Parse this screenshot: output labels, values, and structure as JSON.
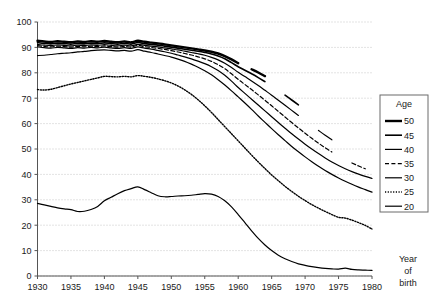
{
  "figure": {
    "title_fragment": "",
    "background": "#ffffff",
    "line_color": "#000000",
    "grid_color": "#b9b9b9"
  },
  "axes": {
    "x_label_lines": [
      "Year",
      "of",
      "birth"
    ],
    "x_ticks": [
      "1930",
      "1935",
      "1940",
      "1945",
      "1950",
      "1955",
      "1960",
      "1965",
      "1970",
      "1975",
      "1980"
    ],
    "y_ticks": [
      "0",
      "10",
      "20",
      "30",
      "40",
      "50",
      "60",
      "70",
      "80",
      "90",
      "100"
    ]
  },
  "legend": {
    "title": "Age",
    "items": [
      {
        "label": "50",
        "style": "solid",
        "width": 2.4
      },
      {
        "label": "45",
        "style": "solid",
        "width": 1.6
      },
      {
        "label": "40",
        "style": "solid",
        "width": 1.2
      },
      {
        "label": "35",
        "style": "dashed",
        "width": 1.2
      },
      {
        "label": "30",
        "style": "solid",
        "width": 1.2
      },
      {
        "label": "25",
        "style": "dotted",
        "width": 1.4
      },
      {
        "label": "20",
        "style": "solid",
        "width": 1.2
      }
    ]
  },
  "chart_data": {
    "type": "line",
    "title": "",
    "xlabel": "Year of birth",
    "ylabel": "",
    "xlim": [
      1930,
      1980
    ],
    "ylim": [
      0,
      100
    ],
    "x_tick_step": 5,
    "y_tick_step": 10,
    "grid": "horizontal-dotted",
    "legend_position": "right",
    "x": [
      1930,
      1931,
      1932,
      1933,
      1934,
      1935,
      1936,
      1937,
      1938,
      1939,
      1940,
      1941,
      1942,
      1943,
      1944,
      1945,
      1946,
      1947,
      1948,
      1949,
      1950,
      1951,
      1952,
      1953,
      1954,
      1955,
      1956,
      1957,
      1958,
      1959,
      1960,
      1961,
      1962,
      1963,
      1964,
      1965,
      1966,
      1967,
      1968,
      1969,
      1970,
      1971,
      1972,
      1973,
      1974,
      1975,
      1976,
      1977,
      1978,
      1979,
      1980
    ],
    "series": [
      {
        "name": "50",
        "style": "solid",
        "width": 2.4,
        "last_year": 1960,
        "stub_year": 1964,
        "values": [
          92.6,
          92.3,
          92.1,
          92.4,
          92.2,
          92.0,
          92.3,
          92.1,
          92.4,
          92.2,
          92.5,
          92.2,
          92.0,
          92.3,
          92.0,
          92.6,
          92.2,
          91.9,
          91.6,
          91.2,
          90.8,
          90.4,
          90.0,
          89.6,
          89.2,
          88.8,
          88.3,
          87.6,
          86.6,
          85.3,
          83.8,
          82.6,
          81.4,
          80.1,
          78.7,
          77.2,
          75.6,
          73.9,
          72.2,
          70.5,
          68.8,
          67.0,
          65.2,
          63.3,
          61.4,
          59.4,
          57.5,
          55.6,
          53.8,
          52.1,
          50.4
        ]
      },
      {
        "name": "45",
        "style": "solid",
        "width": 1.6,
        "last_year": 1964,
        "stub_year": 1969,
        "values": [
          91.9,
          91.6,
          91.4,
          91.7,
          91.5,
          91.3,
          91.6,
          91.4,
          91.7,
          91.5,
          91.8,
          91.5,
          91.3,
          91.6,
          91.3,
          91.9,
          91.5,
          91.2,
          90.9,
          90.5,
          90.1,
          89.7,
          89.3,
          88.9,
          88.5,
          88.0,
          87.4,
          86.6,
          85.5,
          84.0,
          82.4,
          81.0,
          79.6,
          78.1,
          76.5,
          74.8,
          73.0,
          71.2,
          69.3,
          67.4,
          65.5,
          63.6,
          61.7,
          59.8,
          57.9,
          56.0,
          54.2,
          52.5,
          50.9,
          49.4,
          48.0
        ]
      },
      {
        "name": "40",
        "style": "solid",
        "width": 1.2,
        "last_year": 1969,
        "stub_year": 1974,
        "values": [
          91.2,
          90.9,
          90.7,
          91.0,
          90.8,
          90.6,
          90.9,
          90.7,
          91.0,
          90.8,
          91.1,
          90.8,
          90.6,
          90.9,
          90.6,
          91.2,
          90.8,
          90.5,
          90.2,
          89.8,
          89.4,
          89.0,
          88.5,
          88.0,
          87.5,
          86.9,
          86.1,
          85.1,
          83.8,
          82.1,
          80.2,
          78.5,
          76.8,
          75.0,
          73.1,
          71.2,
          69.2,
          67.2,
          65.2,
          63.2,
          61.2,
          59.2,
          57.3,
          55.4,
          53.6,
          51.9,
          50.3,
          48.8,
          47.4,
          46.1,
          44.9
        ]
      },
      {
        "name": "35",
        "style": "dashed",
        "width": 1.2,
        "last_year": 1974,
        "stub_year": 1979,
        "values": [
          90.7,
          90.4,
          90.2,
          90.5,
          90.3,
          90.1,
          90.4,
          90.2,
          90.5,
          90.3,
          90.6,
          90.3,
          90.1,
          90.4,
          90.1,
          90.8,
          90.3,
          90.0,
          89.6,
          89.2,
          88.7,
          88.2,
          87.6,
          87.0,
          86.3,
          85.5,
          84.5,
          83.2,
          81.6,
          79.6,
          77.4,
          75.4,
          73.4,
          71.3,
          69.2,
          67.0,
          64.8,
          62.6,
          60.4,
          58.3,
          56.2,
          54.2,
          52.3,
          50.5,
          48.8,
          47.2,
          45.8,
          44.5,
          43.3,
          42.2,
          41.2
        ]
      },
      {
        "name": "30",
        "style": "solid",
        "width": 1.2,
        "last_year": 1980,
        "stub_year": null,
        "values": [
          90.2,
          89.9,
          89.7,
          90.0,
          89.8,
          89.6,
          89.9,
          89.7,
          90.0,
          89.8,
          90.1,
          89.8,
          89.6,
          89.9,
          89.6,
          90.2,
          89.7,
          89.3,
          88.8,
          88.3,
          87.7,
          87.0,
          86.3,
          85.5,
          84.6,
          83.6,
          82.4,
          80.9,
          79.0,
          76.7,
          74.2,
          71.9,
          69.6,
          67.3,
          65.0,
          62.7,
          60.4,
          58.2,
          56.0,
          53.9,
          51.9,
          50.0,
          48.2,
          46.5,
          44.9,
          43.5,
          42.2,
          41.1,
          40.1,
          39.2,
          38.4
        ]
      },
      {
        "name": "25",
        "style": "dotted",
        "width": 1.4,
        "last_year": 1980,
        "stub_year": null,
        "values": [
          73.4,
          73.2,
          73.5,
          74.2,
          74.9,
          75.6,
          76.2,
          76.8,
          77.4,
          78.0,
          78.6,
          78.5,
          78.4,
          78.6,
          78.4,
          78.9,
          78.6,
          78.2,
          77.6,
          76.9,
          76.0,
          74.8,
          73.3,
          71.5,
          69.4,
          67.0,
          64.4,
          61.6,
          58.8,
          56.0,
          53.2,
          50.4,
          47.6,
          44.9,
          42.3,
          39.8,
          37.5,
          35.3,
          33.3,
          31.4,
          29.7,
          28.1,
          26.7,
          25.4,
          24.2,
          23.1,
          22.8,
          22.0,
          21.0,
          19.9,
          18.5
        ]
      },
      {
        "name": "20",
        "style": "solid",
        "width": 1.2,
        "last_year": 1980,
        "stub_year": null,
        "top_band": true,
        "values": [
          86.8,
          86.9,
          87.2,
          87.5,
          87.7,
          87.9,
          88.2,
          88.4,
          88.7,
          88.9,
          89.0,
          88.8,
          88.6,
          88.8,
          88.5,
          89.1,
          88.5,
          88.0,
          87.4,
          86.8,
          86.2,
          85.4,
          84.5,
          83.4,
          82.2,
          80.8,
          79.2,
          77.3,
          75.2,
          72.9,
          70.5,
          68.1,
          65.6,
          63.0,
          60.5,
          58.0,
          55.6,
          53.3,
          51.0,
          48.9,
          46.9,
          45.0,
          43.2,
          41.5,
          40.0,
          38.6,
          37.3,
          36.1,
          35.0,
          34.0,
          33.0
        ]
      }
    ],
    "bottom_series": {
      "name": "20-bottom",
      "style": "solid",
      "width": 1.2,
      "values": [
        28.6,
        28.0,
        27.4,
        26.8,
        26.4,
        26.1,
        25.4,
        25.5,
        26.2,
        27.4,
        29.6,
        31.0,
        32.4,
        33.6,
        34.4,
        35.1,
        34.0,
        32.8,
        31.6,
        31.2,
        31.3,
        31.5,
        31.6,
        31.8,
        32.1,
        32.4,
        32.2,
        31.3,
        29.6,
        27.2,
        24.2,
        21.0,
        17.8,
        14.8,
        12.2,
        10.0,
        8.2,
        6.8,
        5.7,
        4.8,
        4.2,
        3.7,
        3.3,
        3.0,
        2.8,
        2.7,
        3.1,
        2.6,
        2.4,
        2.3,
        2.2
      ]
    }
  }
}
